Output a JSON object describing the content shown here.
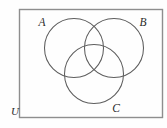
{
  "figure": {
    "kind": "venn-diagram",
    "background_color": "#fefefe",
    "circle_stroke_color": "#5d5d5d",
    "rect_stroke_color": "#8e8e8e",
    "label_color": "#2b2b2b"
  },
  "universe": {
    "label": "U",
    "label_x": 15,
    "label_y": 112,
    "rect": {
      "x": 19.5,
      "y": 9.5,
      "width": 143,
      "height": 108
    }
  },
  "sets": [
    {
      "label": "A",
      "circle": {
        "cx": 74,
        "cy": 48,
        "r": 29.5
      },
      "label_x": 42,
      "label_y": 23
    },
    {
      "label": "B",
      "circle": {
        "cx": 114,
        "cy": 48,
        "r": 29.5
      },
      "label_x": 143,
      "label_y": 23
    },
    {
      "label": "C",
      "circle": {
        "cx": 94,
        "cy": 74,
        "r": 29.5
      },
      "label_x": 116,
      "label_y": 109
    }
  ]
}
